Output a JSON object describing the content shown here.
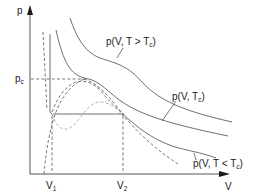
{
  "diagram": {
    "title": "",
    "type": "p-V isotherms (van der Waals, Maxwell construction)",
    "axes": {
      "y_label": "p",
      "x_label": "V"
    },
    "ticks": {
      "pc": {
        "main": "p",
        "sub": "c"
      },
      "v1": {
        "main": "V",
        "sub": "1"
      },
      "v2": {
        "main": "V",
        "sub": "2"
      }
    },
    "curve_labels": {
      "above_tc": {
        "prefix": "p(V, T > T",
        "sub": "c",
        "suffix": ")"
      },
      "at_tc": {
        "prefix": "p(V, T",
        "sub": "c",
        "suffix": ")"
      },
      "below_tc": {
        "prefix": "p(V, T < T",
        "sub": "c",
        "suffix": ")"
      }
    },
    "colors": {
      "curve": "#6f6f6f",
      "axis": "#555555",
      "dashed": "#666666",
      "dashed_light": "#a8a8a8",
      "text": "#1a1a1a"
    }
  }
}
